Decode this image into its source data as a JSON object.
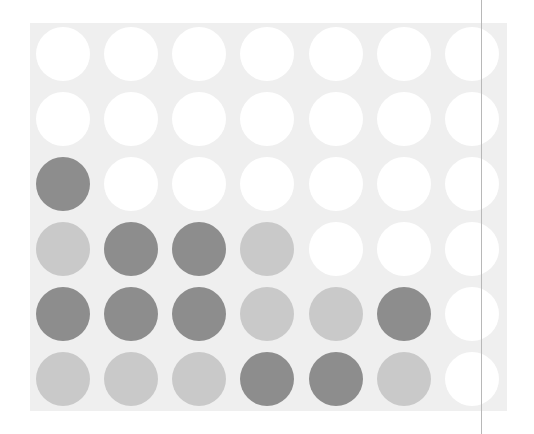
{
  "game": {
    "type": "connect-four",
    "columns": 7,
    "rows": 6,
    "colors": {
      "board": "#efefef",
      "empty": "#ffffff",
      "dark": "#8d8d8d",
      "light": "#c9c9c9"
    },
    "grid": [
      [
        "empty",
        "empty",
        "empty",
        "empty",
        "empty",
        "empty",
        "empty"
      ],
      [
        "empty",
        "empty",
        "empty",
        "empty",
        "empty",
        "empty",
        "empty"
      ],
      [
        "dark",
        "empty",
        "empty",
        "empty",
        "empty",
        "empty",
        "empty"
      ],
      [
        "light",
        "dark",
        "dark",
        "light",
        "empty",
        "empty",
        "empty"
      ],
      [
        "dark",
        "dark",
        "dark",
        "light",
        "light",
        "dark",
        "empty"
      ],
      [
        "light",
        "light",
        "light",
        "dark",
        "dark",
        "light",
        "empty"
      ]
    ],
    "piece_counts": {
      "dark": 8,
      "light": 7,
      "empty": 27
    }
  }
}
